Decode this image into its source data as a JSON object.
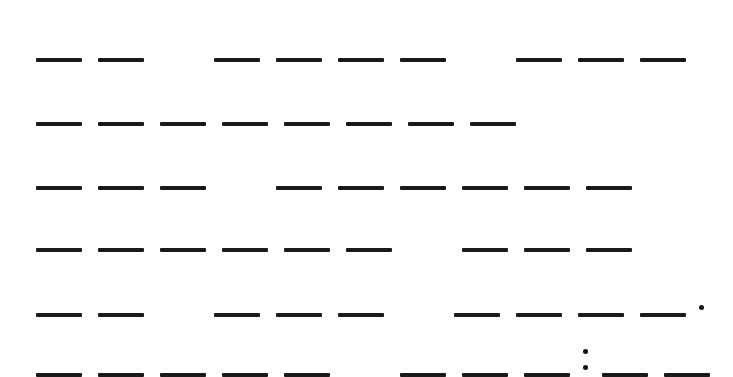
{
  "game": {
    "type": "word-puzzle",
    "slot_color": "#1a1a1a",
    "background": "#ffffff",
    "rows": [
      {
        "top": 56,
        "tokens": [
          "slot",
          "slot",
          "space",
          "slot",
          "slot",
          "slot",
          "slot",
          "space",
          "slot",
          "slot",
          "slot"
        ]
      },
      {
        "top": 120,
        "tokens": [
          "slot",
          "slot",
          "slot",
          "slot",
          "slot",
          "slot",
          "slot",
          "slot"
        ]
      },
      {
        "top": 184,
        "tokens": [
          "slot",
          "slot",
          "slot",
          "space",
          "slot",
          "slot",
          "slot",
          "slot",
          "slot",
          "slot"
        ]
      },
      {
        "top": 246,
        "tokens": [
          "slot",
          "slot",
          "slot",
          "slot",
          "slot",
          "slot",
          "space",
          "slot",
          "slot",
          "slot"
        ]
      },
      {
        "top": 311,
        "tokens": [
          "slot",
          "slot",
          "space",
          "slot",
          "slot",
          "slot",
          "space",
          "slot",
          "slot",
          "slot",
          "slot",
          "period"
        ]
      },
      {
        "top": 371,
        "tokens": [
          "slot",
          "slot",
          "slot",
          "slot",
          "slot",
          "space",
          "slot",
          "slot",
          "slot",
          "colon",
          "slot",
          "slot"
        ]
      }
    ],
    "punctuation": {
      "period": ".",
      "colon": ":"
    }
  }
}
